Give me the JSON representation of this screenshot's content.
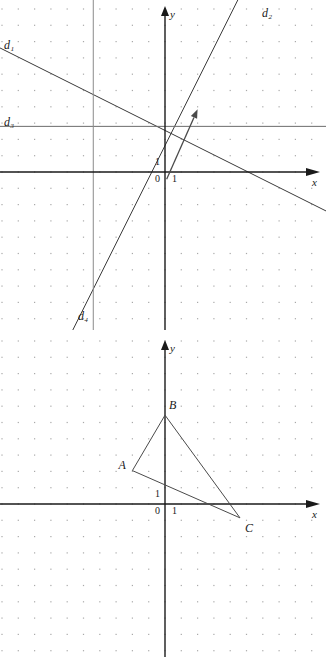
{
  "figures": [
    {
      "id": "upper-graph",
      "name": "lines-graph",
      "origin": {
        "x": 165,
        "y": 172
      },
      "grid": {
        "spacing": 16.3,
        "dot_color": "#9a9a9a",
        "visible": true
      },
      "axes": {
        "x_label": "x",
        "y_label": "y",
        "tick_origin_label": "0",
        "tick_x_label": "1",
        "tick_y_label": "1",
        "color": "#1a1a1a"
      },
      "lines": [
        {
          "name": "d1",
          "label": "d₁",
          "label_x": 4,
          "label_y": 49,
          "slope": -0.5,
          "intercept": 2.55,
          "color": "#3a3a3a"
        },
        {
          "name": "d2",
          "label": "d₂",
          "label_x": 262,
          "label_y": 17,
          "slope": 2.0,
          "intercept": 1.62,
          "color": "#3a3a3a"
        },
        {
          "name": "d3",
          "label": "d₃",
          "label_x": 4,
          "label_y": 126,
          "horizontal_y": 2.8,
          "color": "#6b6b6b"
        },
        {
          "name": "d4",
          "label": "d₄",
          "label_x": 78,
          "label_y": 320,
          "vertical_x": -4.4,
          "color": "#8a8a8a"
        }
      ],
      "vector_arrow": {
        "name": "direction-arrow",
        "from": {
          "x": 0.1,
          "y": -0.45
        },
        "to": {
          "x": 2.0,
          "y": 3.85
        },
        "color": "#4a4a4a"
      }
    },
    {
      "id": "lower-graph",
      "name": "triangle-graph",
      "origin": {
        "x": 165,
        "y": 504
      },
      "grid": {
        "spacing": 16.3,
        "dot_color": "#9a9a9a",
        "visible": true
      },
      "axes": {
        "x_label": "x",
        "y_label": "y",
        "tick_origin_label": "0",
        "tick_x_label": "1",
        "tick_y_label": "1",
        "color": "#1a1a1a"
      },
      "triangle": {
        "name": "triangle-abc",
        "color": "#4a4a4a",
        "vertices": [
          {
            "label": "A",
            "x": -2.0,
            "y": 2.05,
            "label_dx": -14,
            "label_dy": -2
          },
          {
            "label": "B",
            "x": 0.0,
            "y": 5.45,
            "label_dx": 4,
            "label_dy": -6
          },
          {
            "label": "C",
            "x": 4.6,
            "y": -0.85,
            "label_dx": 5,
            "label_dy": 14
          }
        ]
      }
    }
  ]
}
